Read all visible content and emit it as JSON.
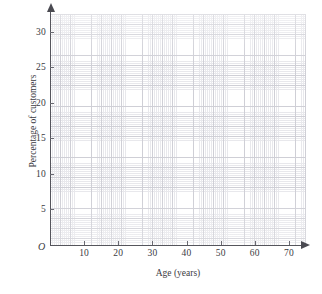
{
  "chart_data": {
    "type": "scatter",
    "title": "",
    "subtitle": "",
    "xlabel": "Age (years)",
    "ylabel": "Percentage of customers",
    "origin_label": "O",
    "grid": "graph-paper",
    "legend": "none",
    "xlim": [
      0,
      75
    ],
    "ylim": [
      0,
      32.5
    ],
    "x_ticks": [
      10,
      20,
      30,
      40,
      50,
      60,
      70
    ],
    "x_tick_labels": [
      "10",
      "20",
      "30",
      "40",
      "50",
      "60",
      "70"
    ],
    "y_ticks": [
      5,
      10,
      15,
      20,
      25,
      30
    ],
    "y_tick_labels": [
      "5",
      "10",
      "15",
      "20",
      "25",
      "30"
    ],
    "x_minor_step": 1,
    "y_minor_step": 0.5,
    "series": [],
    "values": [],
    "categories": [],
    "annotations": [],
    "note": "Empty graph-paper grid with labelled axes and no plotted data"
  },
  "axes": {
    "x_title": "Age (years)",
    "y_title": "Percentage of customers",
    "origin": "O"
  },
  "colors": {
    "grid_minor": "#e8e8ec",
    "grid_major": "#cfcfd6",
    "axis": "#55555c",
    "text": "#3b3b42",
    "background": "#ffffff"
  }
}
